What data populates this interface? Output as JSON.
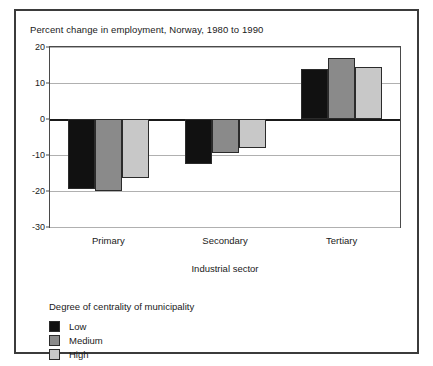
{
  "chart_data": {
    "type": "bar",
    "title": "Percent change in employment, Norway, 1980 to 1990",
    "xlabel": "Industrial sector",
    "ylabel": "",
    "categories": [
      "Primary",
      "Secondary",
      "Tertiary"
    ],
    "series": [
      {
        "name": "Low",
        "color": "#111111",
        "values": [
          -19.5,
          -12.5,
          14.0
        ]
      },
      {
        "name": "Medium",
        "color": "#8a8a8a",
        "values": [
          -20.0,
          -9.5,
          17.0
        ]
      },
      {
        "name": "High",
        "color": "#c8c8c8",
        "values": [
          -16.5,
          -8.0,
          14.5
        ]
      }
    ],
    "ylim": [
      -30,
      20
    ],
    "yticks": [
      20,
      10,
      0,
      -10,
      -20,
      -30
    ],
    "ytick_labels": [
      "20",
      "10",
      "0",
      "-10",
      "-20",
      "-30"
    ],
    "grid": true,
    "legend_position": "below-left",
    "legend_title": "Degree of centrality of municipality"
  }
}
